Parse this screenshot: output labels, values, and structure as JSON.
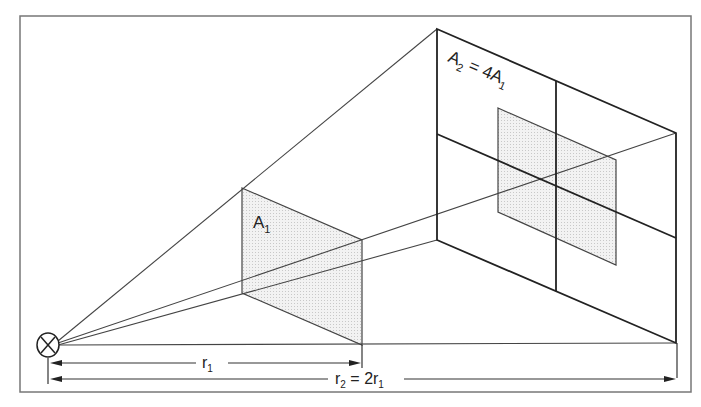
{
  "diagram": {
    "labels": {
      "a1_main": "A",
      "a1_sub": "1",
      "a2_main": "A",
      "a2_sub": "2",
      "a2_eq": " = 4A",
      "a2_eq_sub": "1",
      "r1_main": "r",
      "r1_sub": "1",
      "r2_main": "r",
      "r2_sub": "2",
      "r2_eq": " = 2r",
      "r2_eq_sub": "1"
    },
    "source_icon": "lamp-symbol",
    "colors": {
      "line": "#2a2a2a",
      "frame": "#777777",
      "shade": "#e6e6e6"
    }
  }
}
